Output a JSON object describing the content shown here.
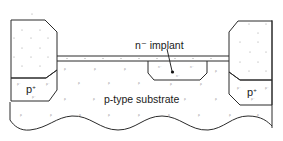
{
  "figure": {
    "labels": {
      "implant": "n⁻ implant",
      "substrate": "p-type substrate",
      "pplus_left": "p",
      "pplus_left_sup": "+",
      "pplus_right": "p",
      "pplus_right_sup": "+"
    },
    "dopant_marks": {
      "substrate": "p",
      "implant_region": "n⁻",
      "channel_stop": "p⁺"
    },
    "regions": [
      {
        "name": "left-field-oxide",
        "type": "oxide"
      },
      {
        "name": "left-channel-stop",
        "type": "p+",
        "label": "p+"
      },
      {
        "name": "thin-oxide",
        "type": "oxide"
      },
      {
        "name": "n-implant-region",
        "type": "n-"
      },
      {
        "name": "right-field-oxide",
        "type": "oxide"
      },
      {
        "name": "right-channel-stop",
        "type": "p+",
        "label": "p+"
      },
      {
        "name": "p-substrate",
        "type": "p"
      }
    ],
    "colors": {
      "line": "#2a2a2a",
      "background": "#ffffff",
      "dopant": "#8a8a8a"
    }
  }
}
